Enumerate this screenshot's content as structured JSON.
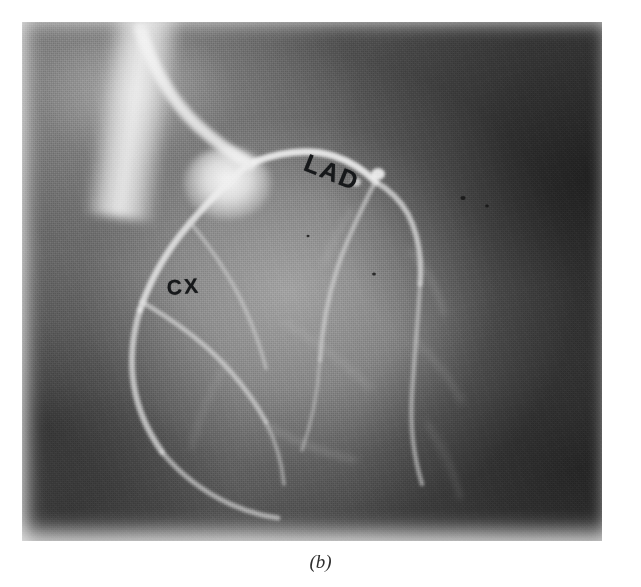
{
  "figure": {
    "caption": "(b)",
    "panel_letter": "b",
    "modality": "coronary angiogram radiograph",
    "background_color": "#ffffff",
    "film_dark_color": "#3e3e3e",
    "film_light_color": "#d8d8d8"
  },
  "annotations": [
    {
      "id": "lad",
      "label": "LAD",
      "meaning": "left anterior descending artery",
      "x": 288,
      "y": 128,
      "rotation_deg": 22,
      "color": "#16181a"
    },
    {
      "id": "cx",
      "label": "CX",
      "meaning": "circumflex artery",
      "x": 144,
      "y": 255,
      "rotation_deg": -4,
      "color": "#16181a"
    }
  ],
  "image_bounds": {
    "left": 22,
    "top": 22,
    "width": 580,
    "height": 519
  }
}
